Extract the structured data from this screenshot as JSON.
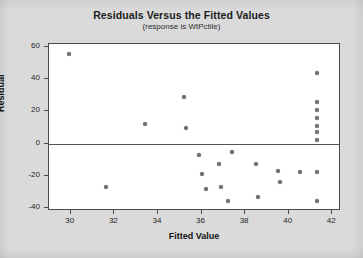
{
  "chart_data": {
    "type": "scatter",
    "title": "Residuals Versus the Fitted Values",
    "subtitle": "(response is WtPctile)",
    "xlabel": "Fitted Value",
    "ylabel": "Residual",
    "xlim": [
      29.0,
      42.4
    ],
    "ylim": [
      -42,
      62
    ],
    "xticks": [
      30,
      32,
      34,
      36,
      38,
      40,
      42
    ],
    "yticks": [
      60,
      40,
      20,
      0,
      -20,
      -40
    ],
    "grid": false,
    "legend": null,
    "reference_line": {
      "orientation": "horizontal",
      "y": 0
    },
    "marker_color": "#6f6f6f",
    "points": [
      {
        "x": 29.9,
        "y": 56
      },
      {
        "x": 31.6,
        "y": -27
      },
      {
        "x": 33.4,
        "y": 12
      },
      {
        "x": 35.2,
        "y": 29
      },
      {
        "x": 35.3,
        "y": 10
      },
      {
        "x": 35.9,
        "y": -7
      },
      {
        "x": 36.0,
        "y": -19
      },
      {
        "x": 36.2,
        "y": -28
      },
      {
        "x": 36.8,
        "y": -13
      },
      {
        "x": 36.9,
        "y": -27
      },
      {
        "x": 37.2,
        "y": -36
      },
      {
        "x": 37.4,
        "y": -5
      },
      {
        "x": 38.5,
        "y": -13
      },
      {
        "x": 38.6,
        "y": -33
      },
      {
        "x": 39.5,
        "y": -17
      },
      {
        "x": 39.6,
        "y": -24
      },
      {
        "x": 40.5,
        "y": -18
      },
      {
        "x": 41.3,
        "y": 44
      },
      {
        "x": 41.3,
        "y": 26
      },
      {
        "x": 41.3,
        "y": 21
      },
      {
        "x": 41.3,
        "y": 16
      },
      {
        "x": 41.3,
        "y": 11
      },
      {
        "x": 41.3,
        "y": 7
      },
      {
        "x": 41.3,
        "y": 2
      },
      {
        "x": 41.3,
        "y": -18
      },
      {
        "x": 41.3,
        "y": -36
      }
    ]
  }
}
